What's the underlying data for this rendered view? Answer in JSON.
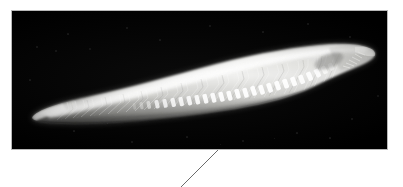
{
  "figure": {
    "panel_label": "",
    "caption": "",
    "background_color": "#ffffff"
  },
  "panel": {
    "name": "specimen-imaging-panel",
    "background_color": "#000000",
    "border_color": "#b8b8b8",
    "x": 11,
    "y": 10,
    "width": 377,
    "height": 140
  },
  "specimen": {
    "label": "",
    "common_name": "lancelet",
    "orientation": "anterior-right",
    "body_color_bright": "#f2f2f0",
    "body_color_mid": "#c9c9c6",
    "body_color_dim": "#7c7c79",
    "body_color_shadow": "#3a3a39",
    "features": {
      "myomeres_label": "chevron muscle segments",
      "myomere_count": 34,
      "gonads_label": "ventral gonad row",
      "gonad_count": 26,
      "notochord_label": "notochord",
      "oral_cirri_label": "oral cirri",
      "tail_fin_label": "caudal fin",
      "rostrum_label": "rostrum"
    }
  },
  "leader_line": {
    "name": "callout-leader-line",
    "color": "#6b6b6b",
    "width": 1,
    "x1": 218,
    "y1": 150,
    "x2": 181,
    "y2": 187
  },
  "noise": {
    "specks": [
      {
        "x": 26,
        "y": 37,
        "r": 0.8
      },
      {
        "x": 45,
        "y": 41,
        "r": 0.7
      },
      {
        "x": 79,
        "y": 39,
        "r": 0.9
      },
      {
        "x": 57,
        "y": 24,
        "r": 0.6
      },
      {
        "x": 116,
        "y": 18,
        "r": 0.7
      },
      {
        "x": 149,
        "y": 30,
        "r": 0.6
      },
      {
        "x": 199,
        "y": 16,
        "r": 0.7
      },
      {
        "x": 252,
        "y": 22,
        "r": 0.6
      },
      {
        "x": 297,
        "y": 14,
        "r": 0.7
      },
      {
        "x": 339,
        "y": 27,
        "r": 0.8
      },
      {
        "x": 355,
        "y": 48,
        "r": 0.7
      },
      {
        "x": 367,
        "y": 86,
        "r": 0.9
      },
      {
        "x": 341,
        "y": 109,
        "r": 0.7
      },
      {
        "x": 286,
        "y": 123,
        "r": 0.6
      },
      {
        "x": 232,
        "y": 131,
        "r": 0.7
      },
      {
        "x": 176,
        "y": 127,
        "r": 0.6
      },
      {
        "x": 121,
        "y": 132,
        "r": 0.7
      },
      {
        "x": 63,
        "y": 121,
        "r": 0.6
      },
      {
        "x": 31,
        "y": 107,
        "r": 0.7
      },
      {
        "x": 19,
        "y": 70,
        "r": 0.6
      },
      {
        "x": 209,
        "y": 134,
        "r": 0.5
      },
      {
        "x": 319,
        "y": 128,
        "r": 0.6
      },
      {
        "x": 96,
        "y": 113,
        "r": 0.5
      },
      {
        "x": 263,
        "y": 128,
        "r": 0.5
      }
    ]
  }
}
